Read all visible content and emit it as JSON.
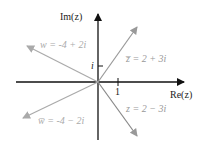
{
  "axes": {
    "x_label": "Re(z)",
    "y_label": "Im(z)",
    "x_tick": "1",
    "y_tick": "i"
  },
  "vectors": [
    {
      "name": "z_bar",
      "label": "z̅ = 2 + 3i",
      "re": 2,
      "im": 3,
      "color": "#999999"
    },
    {
      "name": "z",
      "label": "z = 2 − 3i",
      "re": 2,
      "im": -3,
      "color": "#888888"
    },
    {
      "name": "w",
      "label": "w = -4 + 2i",
      "re": -4,
      "im": 2,
      "color": "#aaaaaa"
    },
    {
      "name": "w_bar",
      "label": "w̅ = -4 − 2i",
      "re": -4,
      "im": -2,
      "color": "#aaaaaa"
    }
  ],
  "colors": {
    "axis": "#111111",
    "text_dark": "#222222",
    "text_light": "#aaaaaa"
  }
}
